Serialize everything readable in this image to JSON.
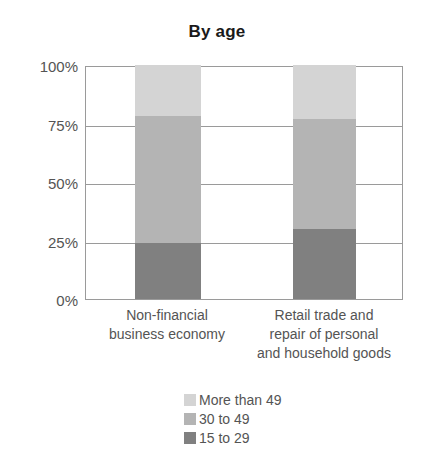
{
  "chart_data": {
    "type": "bar",
    "subtype": "stacked-100-percent",
    "title": "By age",
    "xlabel": "",
    "ylabel": "",
    "ylim": [
      0,
      100
    ],
    "ytick_labels": [
      "100%",
      "75%",
      "50%",
      "25%",
      "0%"
    ],
    "ytick_values": [
      100,
      75,
      50,
      25,
      0
    ],
    "grid": true,
    "legend_position": "bottom",
    "categories": [
      "Non-financial business economy",
      "Retail trade and repair of personal and household goods"
    ],
    "category_lines": [
      [
        "Non-financial",
        "business economy"
      ],
      [
        "Retail trade and",
        "repair of personal",
        "and household goods"
      ]
    ],
    "series": [
      {
        "name": "More than 49",
        "color": "#d4d4d4",
        "values": [
          22,
          23
        ]
      },
      {
        "name": "30 to 49",
        "color": "#b4b4b4",
        "values": [
          54,
          47
        ]
      },
      {
        "name": "15 to 29",
        "color": "#808080",
        "values": [
          24,
          30
        ]
      }
    ],
    "legend_entries": [
      {
        "label": "More than 49",
        "color": "#d4d4d4"
      },
      {
        "label": "30 to 49",
        "color": "#b4b4b4"
      },
      {
        "label": "15 to 29",
        "color": "#808080"
      }
    ],
    "axis_color": "#9a9a9a",
    "text_color": "#545454",
    "title_color": "#1a1a1a"
  }
}
